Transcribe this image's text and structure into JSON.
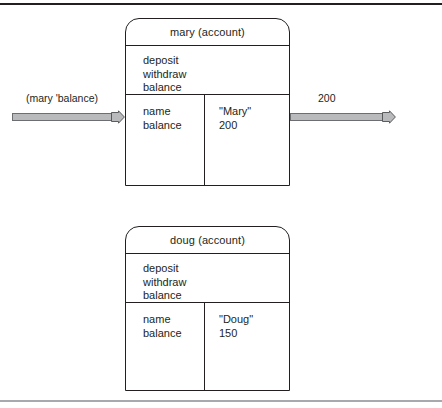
{
  "figure": {
    "objects": [
      {
        "id": "mary",
        "header": "mary (account)",
        "methods": [
          "deposit",
          "withdraw",
          "balance"
        ],
        "fields": [
          {
            "name": "name",
            "value": "\"Mary\""
          },
          {
            "name": "balance",
            "value": "200"
          }
        ]
      },
      {
        "id": "doug",
        "header": "doug (account)",
        "methods": [
          "deposit",
          "withdraw",
          "balance"
        ],
        "fields": [
          {
            "name": "name",
            "value": "\"Doug\""
          },
          {
            "name": "balance",
            "value": "150"
          }
        ]
      }
    ],
    "arrows": [
      {
        "id": "request",
        "label": "(mary 'balance)",
        "direction": "right"
      },
      {
        "id": "response",
        "label": "200",
        "direction": "right"
      }
    ],
    "colors": {
      "ink": "#231f20",
      "arrow_fill": "#b9babc",
      "arrow_stroke": "#6d6e71",
      "frame_rule": "#a7a9ac"
    }
  }
}
